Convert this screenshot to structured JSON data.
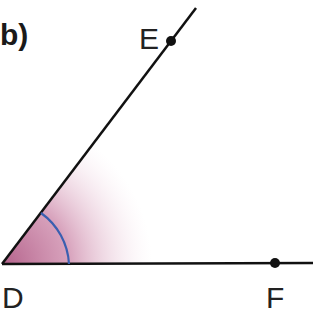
{
  "figure": {
    "part_label": "b)",
    "angle_name": "EDF",
    "vertex": {
      "label": "D",
      "x": 2,
      "y": 264
    },
    "points": [
      {
        "label": "E",
        "x": 171,
        "y": 41
      },
      {
        "label": "F",
        "x": 275,
        "y": 263
      }
    ],
    "colors": {
      "line": "#111111",
      "arc": "#3a5fb0",
      "shade": "#b05a85"
    }
  }
}
